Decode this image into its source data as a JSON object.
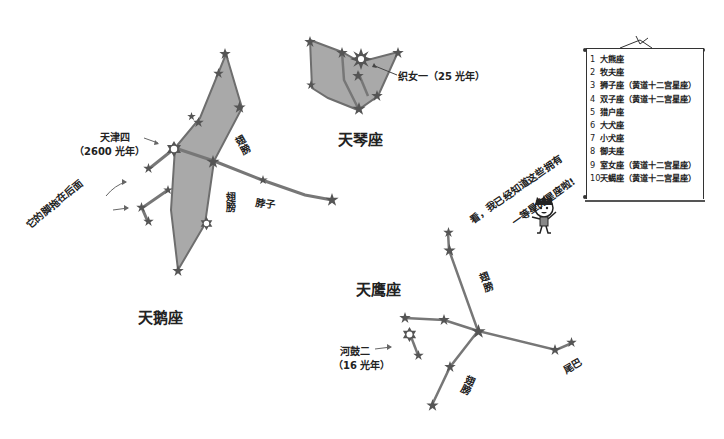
{
  "constellations": {
    "cygnus": {
      "name": "天鹅座",
      "bright_star": "天津四",
      "bright_star_distance": "（2600 光年）",
      "wing_top": "翅膀",
      "wing_bottom": "翅膀",
      "neck": "脖子",
      "feet_note": "它的脚拖在后面"
    },
    "lyra": {
      "name": "天琴座",
      "bright_star_label": "织女一（25 光年）"
    },
    "aquila": {
      "name": "天鹰座",
      "bright_star": "河鼓二",
      "bright_star_distance": "（16 光年）",
      "wing_top": "翅膀",
      "wing_bottom": "翅膀",
      "tail": "尾巴"
    }
  },
  "speech": {
    "line1": "看，我已经知道这些拥有",
    "line2": "一等星的星座啦!"
  },
  "scroll_list": {
    "items": [
      {
        "num": "1",
        "label": "大熊座"
      },
      {
        "num": "2",
        "label": "牧夫座"
      },
      {
        "num": "3",
        "label": "狮子座（黄道十二宫星座）"
      },
      {
        "num": "4",
        "label": "双子座（黄道十二宫星座）"
      },
      {
        "num": "5",
        "label": "猎户座"
      },
      {
        "num": "6",
        "label": "大犬座"
      },
      {
        "num": "7",
        "label": "小犬座"
      },
      {
        "num": "8",
        "label": "御夫座"
      },
      {
        "num": "9",
        "label": "室女座（黄道十二宫星座）"
      },
      {
        "num": "10",
        "label": "天蝎座（黄道十二宫星座）"
      }
    ]
  },
  "colors": {
    "fill": "#a9a9a9",
    "line": "#6e6e6e",
    "star": "#555555",
    "text": "#222222"
  }
}
